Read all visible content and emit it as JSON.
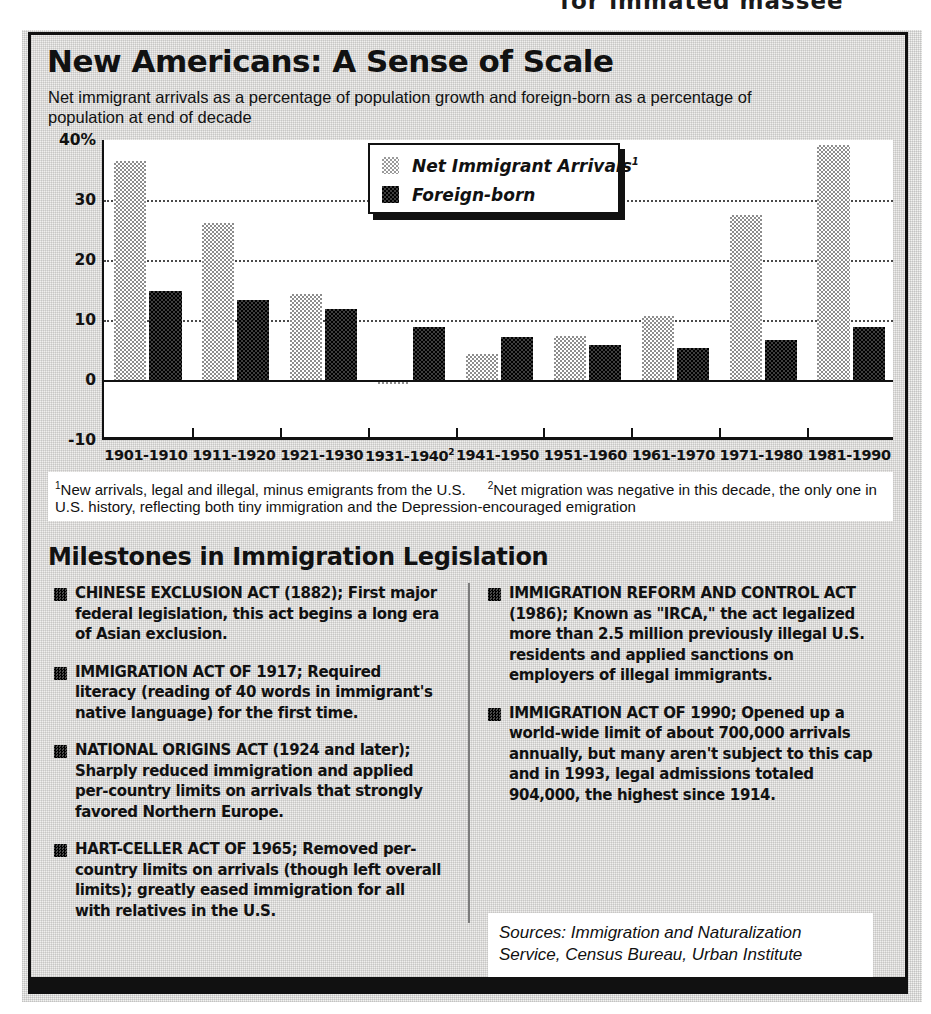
{
  "top_headline": "for immated massee",
  "chart": {
    "title": "New Americans: A Sense of Scale",
    "subtitle": "Net immigrant arrivals as a percentage of population growth and foreign-born as a percentage of population at end of decade",
    "legend": [
      {
        "label": "Net Immigrant Arrivals",
        "marker": "1",
        "swatch": "light"
      },
      {
        "label": "Foreign-born",
        "marker": "",
        "swatch": "dark"
      }
    ],
    "footnote_1_marker": "1",
    "footnote_1": "New arrivals, legal and illegal, minus emigrants from the U.S.",
    "footnote_2_marker": "2",
    "footnote_2": "Net migration was negative in this decade, the only one in U.S. history, reflecting both tiny immigration and the Depression-encouraged emigration"
  },
  "chart_data": {
    "type": "bar",
    "title": "New Americans: A Sense of Scale",
    "subtitle": "Net immigrant arrivals as a percentage of population growth and foreign-born as a percentage of population at end of decade",
    "xlabel": "",
    "ylabel": "",
    "ylim": [
      -10,
      40
    ],
    "yticks": [
      -10,
      0,
      10,
      20,
      30,
      40
    ],
    "ytick_labels": [
      "-10",
      "0",
      "10",
      "20",
      "30",
      "40%"
    ],
    "grid": true,
    "legend_position": "top-center",
    "categories": [
      "1901-1910",
      "1911-1920",
      "1921-1930",
      "1931-1940",
      "1941-1950",
      "1951-1960",
      "1961-1970",
      "1971-1980",
      "1981-1990"
    ],
    "category_markers": [
      "",
      "",
      "",
      "2",
      "",
      "",
      "",
      "",
      ""
    ],
    "series": [
      {
        "name": "Net Immigrant Arrivals",
        "swatch": "light",
        "values": [
          36.5,
          26.2,
          14.3,
          -0.7,
          4.4,
          7.3,
          10.6,
          27.5,
          39.2
        ]
      },
      {
        "name": "Foreign-born",
        "swatch": "dark",
        "values": [
          14.8,
          13.4,
          11.8,
          8.9,
          7.2,
          5.9,
          5.3,
          6.7,
          8.8
        ]
      }
    ]
  },
  "milestones": {
    "heading": "Milestones in Immigration Legislation",
    "left_items": [
      {
        "head": "CHINESE EXCLUSION ACT (1882);",
        "body": " First major federal legislation, this act begins a long era of Asian exclusion."
      },
      {
        "head": "IMMIGRATION ACT OF 1917;",
        "body": " Required literacy (reading of 40 words in immigrant's native language) for the first time."
      },
      {
        "head": "NATIONAL ORIGINS ACT (1924 and later);",
        "body": " Sharply reduced immigration and applied per-country limits on arrivals that strongly favored Northern Europe."
      },
      {
        "head": "HART-CELLER ACT OF 1965;",
        "body": " Removed per-country limits on arrivals (though left overall limits); greatly eased immigration for all with relatives in the U.S."
      }
    ],
    "right_items": [
      {
        "head": "IMMIGRATION REFORM AND CONTROL ACT (1986);",
        "body": " Known as \"IRCA,\" the act legalized more than 2.5 million previously illegal U.S. residents and applied sanctions on employers of illegal immigrants."
      },
      {
        "head": "IMMIGRATION ACT OF 1990;",
        "body": " Opened up a world-wide limit of about 700,000 arrivals annually, but many aren't subject to this cap and in 1993, legal admissions totaled 904,000, the highest since 1914."
      }
    ]
  },
  "sources": {
    "text": "Sources: Immigration and Naturalization Service, Census Bureau, Urban Institute"
  }
}
